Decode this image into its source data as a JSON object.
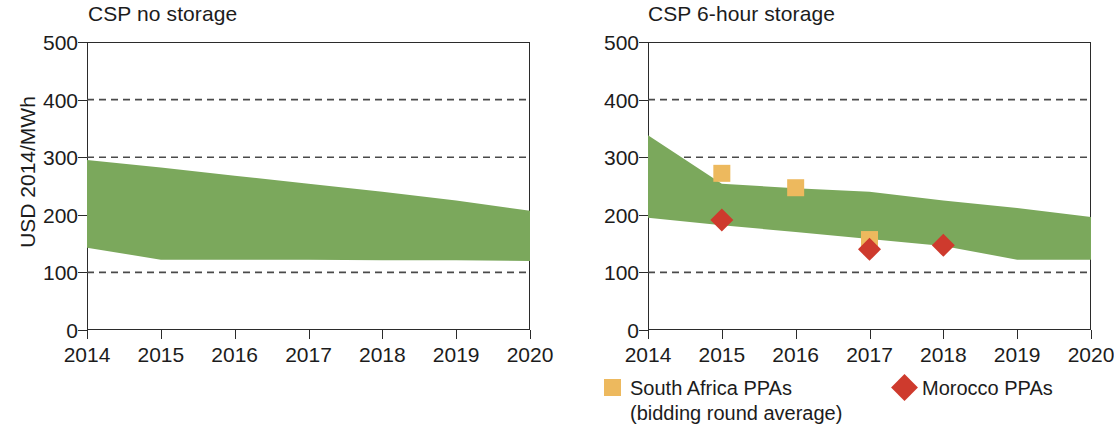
{
  "figure": {
    "width": 1107,
    "height": 434,
    "ylabel": "USD 2014/MWh",
    "band_color": "#7ba85c",
    "square_color": "#edb95e",
    "diamond_color": "#ce3a2d",
    "axis_color": "#2b2b2b",
    "grid_color": "#4a4a4a"
  },
  "legend": {
    "south_africa": {
      "label": "South Africa PPAs",
      "sublabel": "(bidding round average)",
      "marker": "square-marker",
      "color": "#edb95e"
    },
    "morocco": {
      "label": "Morocco PPAs",
      "marker": "diamond-marker",
      "color": "#ce3a2d"
    }
  },
  "chart_data": [
    {
      "id": "csp-no-storage",
      "type": "area",
      "title": "CSP no storage",
      "xlabel": "",
      "ylabel": "USD 2014/MWh",
      "x": [
        2014,
        2015,
        2016,
        2017,
        2018,
        2019,
        2020
      ],
      "xlim": [
        2014,
        2020
      ],
      "ylim": [
        0,
        500
      ],
      "yticks": [
        0,
        100,
        200,
        300,
        400,
        500
      ],
      "xticks": [
        "2014",
        "2015",
        "2016",
        "2017",
        "2018",
        "2019",
        "2020"
      ],
      "grid": "horizontal-dashed at 100, 300, 400",
      "legend": "none",
      "series": [
        {
          "name": "upper bound",
          "values": [
            295,
            282,
            268,
            254,
            240,
            225,
            207
          ]
        },
        {
          "name": "lower bound",
          "values": [
            143,
            122,
            122,
            122,
            121,
            121,
            120
          ]
        }
      ]
    },
    {
      "id": "csp-6-hour-storage",
      "type": "area",
      "title": "CSP 6-hour storage",
      "xlabel": "",
      "ylabel": "USD 2014/MWh",
      "x": [
        2014,
        2015,
        2016,
        2017,
        2018,
        2019,
        2020
      ],
      "xlim": [
        2014,
        2020
      ],
      "ylim": [
        0,
        500
      ],
      "yticks": [
        0,
        100,
        200,
        300,
        400,
        500
      ],
      "xticks": [
        "2014",
        "2015",
        "2016",
        "2017",
        "2018",
        "2019",
        "2020"
      ],
      "grid": "horizontal-dashed at 100, 300, 400",
      "legend": "below-plot",
      "series": [
        {
          "name": "upper bound",
          "values": [
            338,
            254,
            246,
            240,
            225,
            212,
            196
          ]
        },
        {
          "name": "lower bound",
          "values": [
            195,
            182,
            170,
            158,
            146,
            122,
            122
          ]
        }
      ],
      "markers": [
        {
          "name": "South Africa PPAs",
          "marker": "square-marker",
          "color": "#edb95e",
          "points": [
            {
              "x": 2015,
              "y": 272
            },
            {
              "x": 2016,
              "y": 247
            },
            {
              "x": 2017,
              "y": 157
            }
          ]
        },
        {
          "name": "Morocco PPAs",
          "marker": "diamond-marker",
          "color": "#ce3a2d",
          "points": [
            {
              "x": 2015,
              "y": 191
            },
            {
              "x": 2017,
              "y": 140
            },
            {
              "x": 2018,
              "y": 147
            }
          ]
        }
      ]
    }
  ]
}
